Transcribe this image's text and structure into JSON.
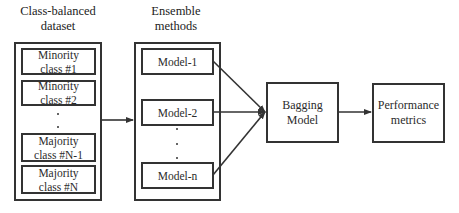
{
  "diagram": {
    "groups": [
      {
        "id": "dataset",
        "title": "Class-balanced\ndataset",
        "items": [
          {
            "label": "Minority\nclass #1"
          },
          {
            "label": "Minority\nclass #2"
          },
          {
            "label": "Majority\nclass #N-1"
          },
          {
            "label": "Majority\nclass #N"
          }
        ],
        "ellipsis": "⋮"
      },
      {
        "id": "ensemble",
        "title": "Ensemble\nmethods",
        "items": [
          {
            "label": "Model-1"
          },
          {
            "label": "Model-2"
          },
          {
            "label": "Model-n"
          }
        ],
        "ellipsis": "⋮"
      }
    ],
    "nodes": {
      "bagging": {
        "label": "Bagging\nModel"
      },
      "performance": {
        "label": "Performance\nmetrics"
      }
    },
    "edges": [
      {
        "from": "Class-balanced dataset",
        "to": "Ensemble methods"
      },
      {
        "from": "Model-1",
        "to": "Bagging Model"
      },
      {
        "from": "Model-2",
        "to": "Bagging Model"
      },
      {
        "from": "Model-n",
        "to": "Bagging Model"
      },
      {
        "from": "Bagging Model",
        "to": "Performance metrics"
      }
    ],
    "colors": {
      "stroke": "#333333",
      "background": "#ffffff",
      "text": "#2b2b2b"
    }
  }
}
